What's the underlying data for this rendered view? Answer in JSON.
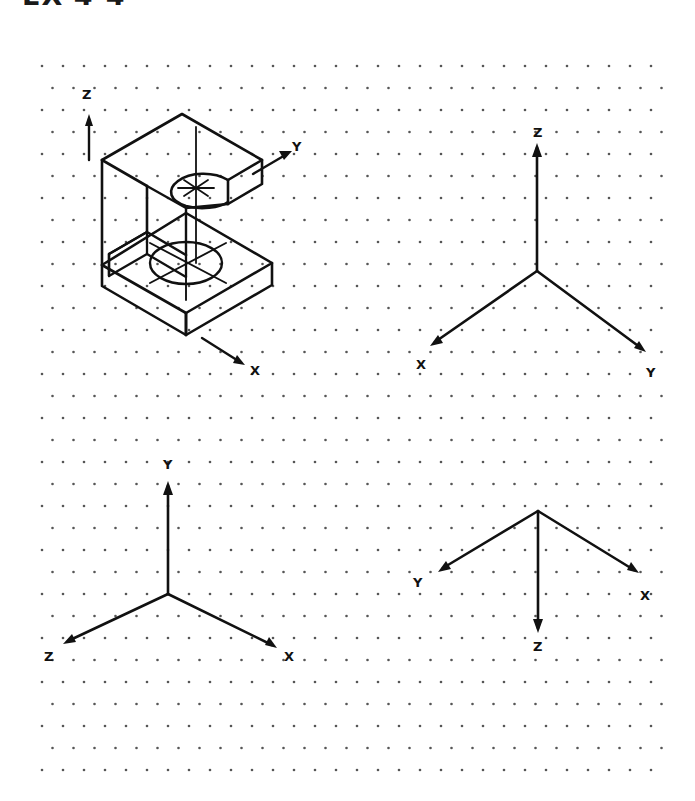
{
  "page": {
    "title_partial": "EX 4-4",
    "width": 695,
    "height": 801,
    "background": "#ffffff",
    "ink_color": "#111111",
    "dot_color": "#555555"
  },
  "grid": {
    "type": "isometric-dot-grid",
    "origin_x": 42,
    "origin_y": 66,
    "col_spacing": 21.0,
    "row_spacing": 22.0,
    "stagger_offset": 10.5,
    "cols": 30,
    "rows": 33,
    "dot_radius": 1.3
  },
  "figures": [
    {
      "id": "isometric-part",
      "name": "isometric-c-block-pictorial",
      "caption": "",
      "axes": [
        {
          "label": "Z",
          "x": 82,
          "y": 95,
          "direction": "up"
        },
        {
          "label": "Y",
          "x": 292,
          "y": 147,
          "direction": "up-right"
        },
        {
          "label": "X",
          "x": 253,
          "y": 371,
          "direction": "down-right"
        }
      ]
    },
    {
      "id": "axes-top-right",
      "name": "axis-triad-z-up",
      "axes": [
        {
          "label": "Z",
          "x": 533,
          "y": 128,
          "direction": "up"
        },
        {
          "label": "X",
          "x": 418,
          "y": 363,
          "direction": "down-left"
        },
        {
          "label": "Y",
          "x": 646,
          "y": 372,
          "direction": "down-right"
        }
      ]
    },
    {
      "id": "axes-bottom-left",
      "name": "axis-triad-y-up",
      "axes": [
        {
          "label": "Y",
          "x": 164,
          "y": 462,
          "direction": "up"
        },
        {
          "label": "Z",
          "x": 46,
          "y": 655,
          "direction": "down-left"
        },
        {
          "label": "X",
          "x": 285,
          "y": 655,
          "direction": "down-right"
        }
      ]
    },
    {
      "id": "axes-bottom-right",
      "name": "axis-triad-z-down",
      "axes": [
        {
          "label": "Y",
          "x": 415,
          "y": 581,
          "direction": "up-left"
        },
        {
          "label": "X",
          "x": 641,
          "y": 593,
          "direction": "up-right"
        },
        {
          "label": "Z",
          "x": 535,
          "y": 643,
          "direction": "down"
        }
      ]
    }
  ]
}
